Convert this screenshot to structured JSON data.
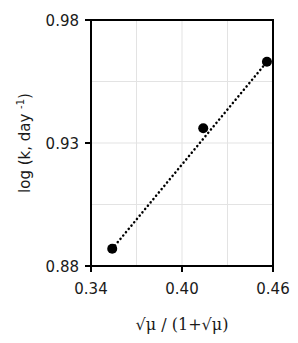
{
  "chart_data": {
    "type": "scatter",
    "title": "",
    "xlabel": "√μ / (1+√μ)",
    "ylabel": "log (k, day⁻¹)",
    "ylabel_parts": {
      "main": "log (k, day ",
      "sup": "-1",
      "close": ")"
    },
    "xlim": [
      0.34,
      0.46
    ],
    "ylim": [
      0.88,
      0.98
    ],
    "xticks": [
      0.34,
      0.4,
      0.46
    ],
    "xtick_labels": [
      "0.34",
      "0.40",
      "0.46"
    ],
    "yticks": [
      0.88,
      0.93,
      0.98
    ],
    "ytick_labels": [
      "0.88",
      "0.93",
      "0.98"
    ],
    "grid": true,
    "legend": null,
    "series": [
      {
        "name": "data",
        "marker": "circle",
        "color": "#000000",
        "x": [
          0.354,
          0.414,
          0.456
        ],
        "y": [
          0.887,
          0.936,
          0.963
        ]
      }
    ],
    "trendline": {
      "style": "dotted",
      "color": "#000000",
      "x": [
        0.354,
        0.456
      ],
      "y": [
        0.887,
        0.963
      ]
    }
  },
  "colors": {
    "axis": "#000000",
    "grid": "#e3e3e3",
    "marker": "#000000"
  }
}
